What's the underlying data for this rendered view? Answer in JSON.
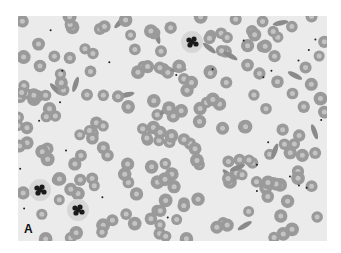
{
  "figure": {
    "panel_label": "A",
    "colors": {
      "background": "#ebebeb",
      "rbc_fill": "#9a9a9a",
      "rbc_center": "#c4c4c4",
      "nucleus": "#1a1a1a"
    }
  }
}
